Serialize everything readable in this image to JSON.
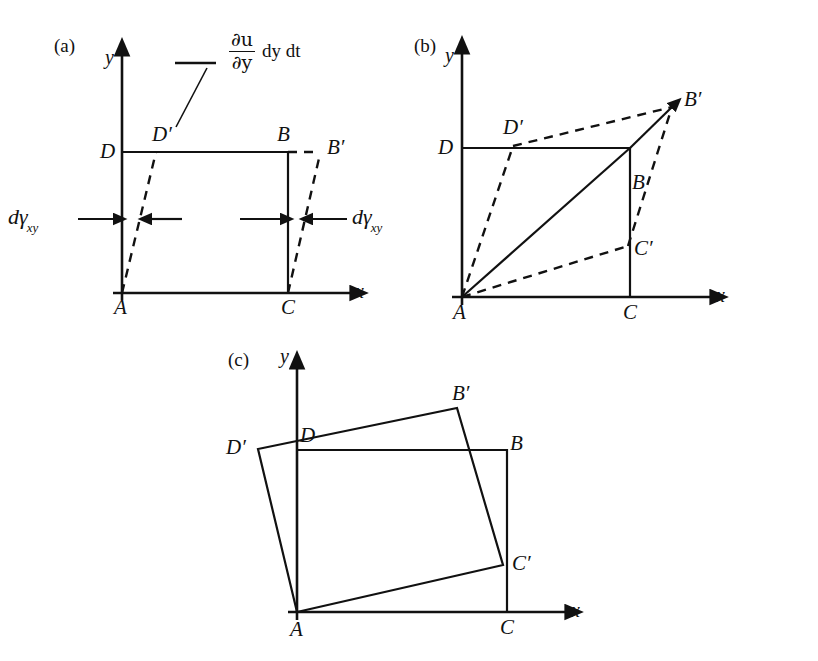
{
  "figure": {
    "background": "#ffffff",
    "ink_color": "#111111"
  },
  "panels": [
    {
      "tag": "(a)",
      "axes": {
        "x_label": "x",
        "y_label": "y"
      },
      "vertices": [
        {
          "name": "A",
          "label": "A"
        },
        {
          "name": "C",
          "label": "C"
        },
        {
          "name": "B",
          "label": "B"
        },
        {
          "name": "D",
          "label": "D"
        },
        {
          "name": "D-prime",
          "label": "D′"
        },
        {
          "name": "B-prime",
          "label": "B′"
        }
      ],
      "annotations": {
        "formula_numerator": "∂u",
        "formula_denominator": "∂y",
        "formula_suffix": "dy dt",
        "shear_label_left": "dγ",
        "shear_label_left_sub": "xy",
        "shear_label_right": "dγ",
        "shear_label_right_sub": "xy"
      }
    },
    {
      "tag": "(b)",
      "axes": {
        "x_label": "x",
        "y_label": "y"
      },
      "vertices": [
        {
          "name": "A",
          "label": "A"
        },
        {
          "name": "C",
          "label": "C"
        },
        {
          "name": "B",
          "label": "B"
        },
        {
          "name": "D",
          "label": "D"
        },
        {
          "name": "D-prime",
          "label": "D′"
        },
        {
          "name": "B-prime",
          "label": "B′"
        },
        {
          "name": "C-prime",
          "label": "C′"
        }
      ]
    },
    {
      "tag": "(c)",
      "axes": {
        "x_label": "x",
        "y_label": "y"
      },
      "vertices": [
        {
          "name": "A",
          "label": "A"
        },
        {
          "name": "C",
          "label": "C"
        },
        {
          "name": "B",
          "label": "B"
        },
        {
          "name": "D",
          "label": "D"
        },
        {
          "name": "D-prime",
          "label": "D′"
        },
        {
          "name": "B-prime",
          "label": "B′"
        },
        {
          "name": "C-prime",
          "label": "C′"
        }
      ]
    }
  ]
}
